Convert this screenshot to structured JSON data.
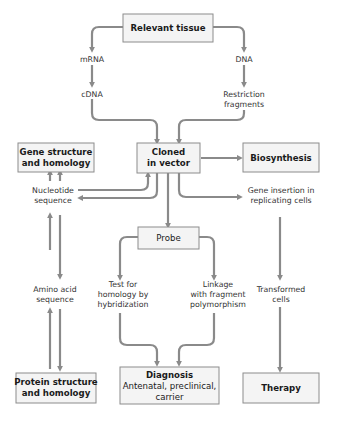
{
  "diagram": {
    "colors": {
      "box_fill": "#f4f4f4",
      "box_border": "#8c8c8c",
      "arrow": "#8a8a8a",
      "text": "#1a1a1a"
    },
    "boxes": {
      "relevant_tissue": {
        "lines": [
          "Relevant tissue"
        ]
      },
      "cloned_in_vector": {
        "lines": [
          "Cloned",
          "in vector"
        ]
      },
      "gene_structure": {
        "lines": [
          "Gene structure",
          "and homology"
        ]
      },
      "biosynthesis": {
        "lines": [
          "Biosynthesis"
        ]
      },
      "probe": {
        "lines": [
          "Probe"
        ]
      },
      "protein_structure": {
        "lines": [
          "Protein structure",
          "and homology"
        ]
      },
      "diagnosis": {
        "lines": [
          "Diagnosis",
          "Antenatal, preclinical,",
          "carrier"
        ]
      },
      "therapy": {
        "lines": [
          "Therapy"
        ]
      }
    },
    "labels": {
      "mrna": {
        "lines": [
          "mRNA"
        ]
      },
      "dna": {
        "lines": [
          "DNA"
        ]
      },
      "cdna": {
        "lines": [
          "cDNA"
        ]
      },
      "restriction_fragments": {
        "lines": [
          "Restriction",
          "fragments"
        ]
      },
      "nucleotide_sequence": {
        "lines": [
          "Nucleotide",
          "sequence"
        ]
      },
      "gene_insertion": {
        "lines": [
          "Gene insertion in",
          "replicating cells"
        ]
      },
      "amino_acid_sequence": {
        "lines": [
          "Amino acid",
          "sequence"
        ]
      },
      "test_homology": {
        "lines": [
          "Test for",
          "homology by",
          "hybridization"
        ]
      },
      "linkage": {
        "lines": [
          "Linkage",
          "with fragment",
          "polymorphism"
        ]
      },
      "transformed_cells": {
        "lines": [
          "Transformed",
          "cells"
        ]
      }
    }
  }
}
